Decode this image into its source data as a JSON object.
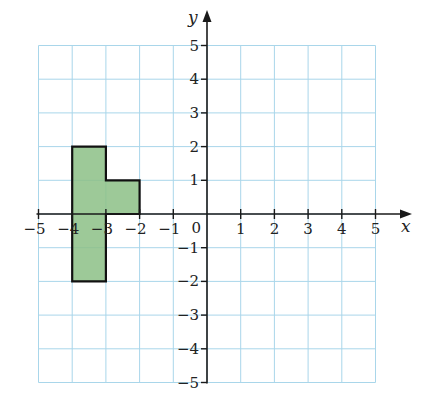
{
  "diagram": {
    "type": "coordinate-grid",
    "x_axis": {
      "label": "x",
      "min": -5,
      "max": 5,
      "ticks": [
        -5,
        -4,
        -3,
        -2,
        -1,
        1,
        2,
        3,
        4,
        5
      ]
    },
    "y_axis": {
      "label": "y",
      "min": -5,
      "max": 5,
      "ticks": [
        -5,
        -4,
        -3,
        -2,
        -1,
        1,
        2,
        3,
        4,
        5
      ]
    },
    "origin_label": "0",
    "shape": {
      "name": "green-polygon",
      "fill_color": "#8cbf86",
      "stroke_color": "#111111",
      "vertices": [
        [
          -4,
          2
        ],
        [
          -3,
          2
        ],
        [
          -3,
          1
        ],
        [
          -2,
          1
        ],
        [
          -2,
          0
        ],
        [
          -3,
          0
        ],
        [
          -3,
          -2
        ],
        [
          -4,
          -2
        ]
      ]
    },
    "colors": {
      "grid": "#a9d6ea",
      "axis": "#1a1a1a"
    }
  }
}
